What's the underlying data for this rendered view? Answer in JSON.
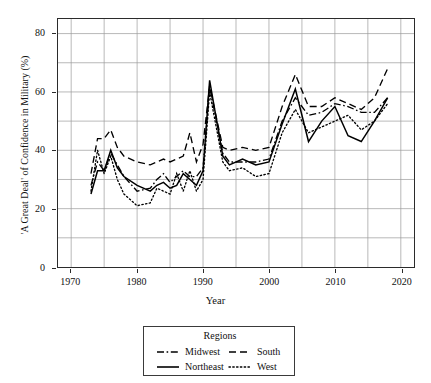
{
  "chart_data": {
    "type": "line",
    "title": "",
    "xlabel": "Year",
    "ylabel": "'A Great Deal' of Confidence in Military (%)",
    "xlim": [
      1968,
      2022
    ],
    "ylim": [
      0,
      85
    ],
    "xticks": [
      1970,
      1980,
      1990,
      2000,
      2010,
      2020
    ],
    "yticks": [
      0,
      20,
      40,
      60,
      80
    ],
    "grid": true,
    "grid_minor_x_step": 5,
    "grid_minor_y_step": 10,
    "legend": {
      "title": "Regions",
      "position": "below-plot",
      "entries": [
        {
          "name": "Midwest",
          "dash": "dashdot",
          "sample": "-·-"
        },
        {
          "name": "South",
          "dash": "dashed",
          "sample": "- -"
        },
        {
          "name": "Northeast",
          "dash": "solid",
          "sample": "—"
        },
        {
          "name": "West",
          "dash": "dotted",
          "sample": "····"
        }
      ]
    },
    "x": [
      1973,
      1974,
      1975,
      1976,
      1977,
      1978,
      1980,
      1982,
      1983,
      1984,
      1985,
      1986,
      1987,
      1988,
      1989,
      1990,
      1991,
      1993,
      1994,
      1996,
      1998,
      2000,
      2002,
      2004,
      2006,
      2008,
      2010,
      2012,
      2014,
      2016,
      2018
    ],
    "series": [
      {
        "name": "Northeast",
        "dash": "solid",
        "color": "#000000",
        "values": [
          25,
          33,
          33,
          40,
          34,
          31,
          28,
          26,
          28,
          29,
          27,
          28,
          32,
          30,
          28,
          33,
          64,
          38,
          35,
          37,
          35,
          36,
          49,
          61,
          43,
          50,
          55,
          45,
          43,
          50,
          58
        ]
      },
      {
        "name": "Midwest",
        "dash": "dashdot",
        "color": "#000000",
        "values": [
          28,
          36,
          33,
          39,
          35,
          31,
          26,
          27,
          30,
          32,
          29,
          31,
          33,
          31,
          31,
          34,
          62,
          39,
          36,
          36,
          36,
          37,
          50,
          58,
          52,
          53,
          56,
          55,
          53,
          53,
          58
        ]
      },
      {
        "name": "South",
        "dash": "dashed",
        "color": "#000000",
        "values": [
          32,
          44,
          44,
          47,
          41,
          38,
          36,
          35,
          36,
          37,
          36,
          37,
          38,
          46,
          36,
          42,
          62,
          41,
          40,
          41,
          40,
          41,
          55,
          66,
          55,
          55,
          58,
          56,
          54,
          58,
          68
        ]
      },
      {
        "name": "West",
        "dash": "dotted",
        "color": "#000000",
        "values": [
          26,
          40,
          32,
          38,
          30,
          25,
          21,
          22,
          27,
          26,
          25,
          32,
          26,
          33,
          26,
          30,
          60,
          36,
          33,
          34,
          31,
          32,
          46,
          54,
          46,
          48,
          50,
          52,
          47,
          50,
          56
        ]
      }
    ]
  },
  "axis": {
    "ytick_labels": [
      "0",
      "20",
      "40",
      "60",
      "80"
    ],
    "xtick_labels": [
      "1970",
      "1980",
      "1990",
      "2000",
      "2010",
      "2020"
    ]
  }
}
